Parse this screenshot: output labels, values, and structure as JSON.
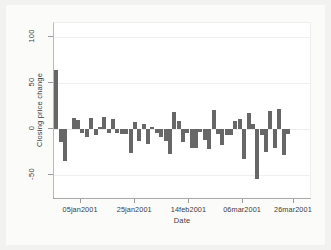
{
  "chart_data": {
    "type": "bar",
    "title": "",
    "subtitle": "",
    "xlabel": "Date",
    "ylabel": "Closing price change",
    "ylim": [
      -75,
      115
    ],
    "yticks": [
      100,
      50,
      0,
      -50
    ],
    "ytick_labels": [
      "100",
      "50",
      "0",
      "-50"
    ],
    "xtick_labels": [
      "05jan2001",
      "25jan2001",
      "14feb2001",
      "06mar2001",
      "26mar2001"
    ],
    "xtick_values": [
      "05jan2001",
      "25jan2001",
      "14feb2001",
      "06mar2001",
      "26mar2001"
    ],
    "xlim": [
      "02jan2001",
      "30mar2001"
    ],
    "grid": false,
    "legend": null,
    "bar_color": "#676767",
    "background_color": "#ffffff",
    "figure_background_color": "#f2f2f1",
    "axis_color": "#aaaaaa",
    "categories": [
      "03jan2001",
      "04jan2001",
      "05jan2001",
      "08jan2001",
      "09jan2001",
      "10jan2001",
      "11jan2001",
      "12jan2001",
      "16jan2001",
      "17jan2001",
      "18jan2001",
      "19jan2001",
      "22jan2001",
      "23jan2001",
      "24jan2001",
      "25jan2001",
      "26jan2001",
      "29jan2001",
      "30jan2001",
      "31jan2001",
      "01feb2001",
      "02feb2001",
      "05feb2001",
      "06feb2001",
      "07feb2001",
      "08feb2001",
      "09feb2001",
      "12feb2001",
      "13feb2001",
      "14feb2001",
      "15feb2001",
      "16feb2001",
      "20feb2001",
      "21feb2001",
      "22feb2001",
      "23feb2001",
      "26feb2001",
      "27feb2001",
      "28feb2001",
      "01mar2001",
      "02mar2001",
      "05mar2001",
      "06mar2001",
      "07mar2001",
      "08mar2001",
      "09mar2001",
      "12mar2001",
      "13mar2001",
      "14mar2001",
      "15mar2001",
      "16mar2001",
      "19mar2001",
      "20mar2001",
      "21mar2001",
      "22mar2001",
      "23mar2001",
      "26mar2001",
      "27mar2001",
      "28mar2001"
    ],
    "values": [
      64,
      -14,
      -35,
      0,
      12,
      10,
      -4,
      -9,
      12,
      -7,
      2,
      13,
      -4,
      11,
      -4,
      -5,
      -6,
      -26,
      7,
      -13,
      5,
      -16,
      2,
      -4,
      -9,
      -13,
      -27,
      18,
      9,
      -14,
      -4,
      -21,
      -21,
      -3,
      -12,
      -22,
      21,
      -5,
      -18,
      -7,
      -7,
      9,
      11,
      -33,
      17,
      5,
      -54,
      -7,
      -25,
      20,
      -21,
      22,
      -28,
      -5,
      0,
      0,
      0,
      0,
      0
    ],
    "n_bars": 59,
    "series_name": "Closing price change"
  }
}
